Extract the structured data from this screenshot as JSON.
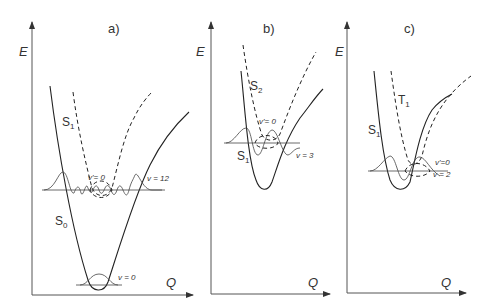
{
  "panels": [
    {
      "id": "a",
      "label": "a)",
      "y_axis": "E",
      "x_axis": "Q",
      "curves": [
        {
          "name": "S0",
          "label": "S",
          "sub": "0",
          "style": "solid"
        },
        {
          "name": "S1",
          "label": "S",
          "sub": "1",
          "style": "dashed"
        }
      ],
      "levels": [
        {
          "label": "v = 12"
        },
        {
          "label": "v'= 0"
        },
        {
          "label": "v = 0"
        }
      ]
    },
    {
      "id": "b",
      "label": "b)",
      "y_axis": "E",
      "x_axis": "Q",
      "curves": [
        {
          "name": "S1",
          "label": "S",
          "sub": "1",
          "style": "solid"
        },
        {
          "name": "S2",
          "label": "S",
          "sub": "2",
          "style": "dashed"
        }
      ],
      "levels": [
        {
          "label": "v'= 0"
        },
        {
          "label": "v = 3"
        }
      ]
    },
    {
      "id": "c",
      "label": "c)",
      "y_axis": "E",
      "x_axis": "Q",
      "curves": [
        {
          "name": "S1",
          "label": "S",
          "sub": "1",
          "style": "solid"
        },
        {
          "name": "T1",
          "label": "T",
          "sub": "1",
          "style": "dashed"
        }
      ],
      "levels": [
        {
          "label": "v'=0"
        },
        {
          "label": "v = 2"
        }
      ]
    }
  ]
}
